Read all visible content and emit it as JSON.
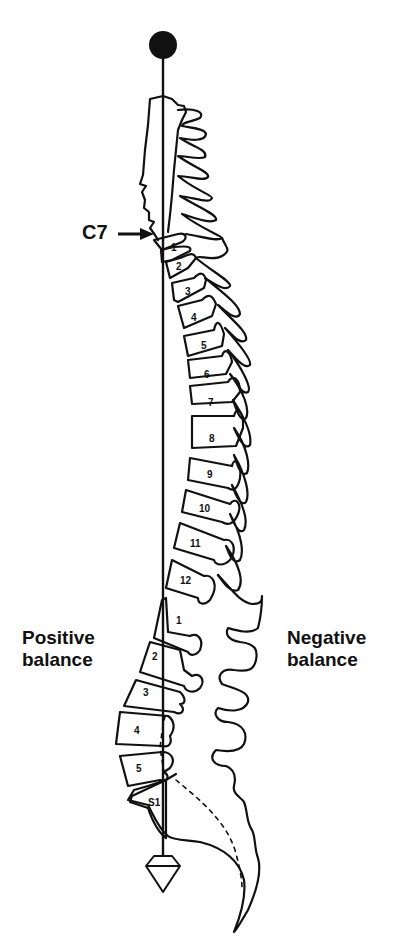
{
  "figure": {
    "type": "sagittal spine diagram with C7 plumb line",
    "labels": {
      "c7": "C7",
      "positive_line1": "Positive",
      "positive_line2": "balance",
      "negative_line1": "Negative",
      "negative_line2": "balance"
    },
    "thoracic_vertebrae": [
      "1",
      "2",
      "3",
      "4",
      "5",
      "6",
      "7",
      "8",
      "9",
      "10",
      "11",
      "12"
    ],
    "lumbar_vertebrae": [
      "1",
      "2",
      "3",
      "4",
      "5"
    ],
    "sacral": "S1",
    "plumb_line": {
      "top_weight": "filled-circle",
      "bottom_weight": "diamond-plumb-bob"
    },
    "colors": {
      "ink": "#111111",
      "background": "#ffffff"
    }
  }
}
